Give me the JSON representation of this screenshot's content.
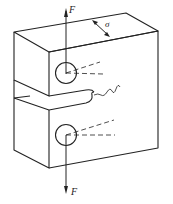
{
  "diagram": {
    "type": "compact-tension-specimen",
    "labels": {
      "force_top": "F",
      "force_bottom": "F",
      "stress": "σ"
    },
    "colors": {
      "line": "#222222",
      "background": "#ffffff"
    }
  }
}
